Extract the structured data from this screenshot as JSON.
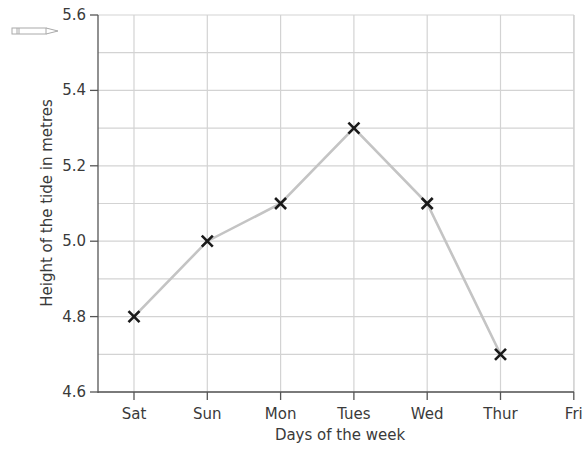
{
  "chart_data": {
    "type": "line",
    "title": "",
    "xlabel": "Days of the week",
    "ylabel": "Height of the tide in metres",
    "categories": [
      "Sat",
      "Sun",
      "Mon",
      "Tues",
      "Wed",
      "Thur",
      "Fri"
    ],
    "series": [
      {
        "name": "Tide height",
        "values": [
          4.8,
          5.0,
          5.1,
          5.3,
          5.1,
          4.7,
          null
        ]
      }
    ],
    "yticks": [
      "4.6",
      "4.8",
      "5.0",
      "5.2",
      "5.4",
      "5.6"
    ],
    "ylim": [
      4.6,
      5.6
    ],
    "y_minor_step": 0.1,
    "grid": true,
    "marker": "x",
    "line_color": "#c4c4c4",
    "marker_color": "#1a1a1a",
    "grid_color": "#d3d3d3"
  },
  "decoration": {
    "icon": "pencil-icon"
  }
}
